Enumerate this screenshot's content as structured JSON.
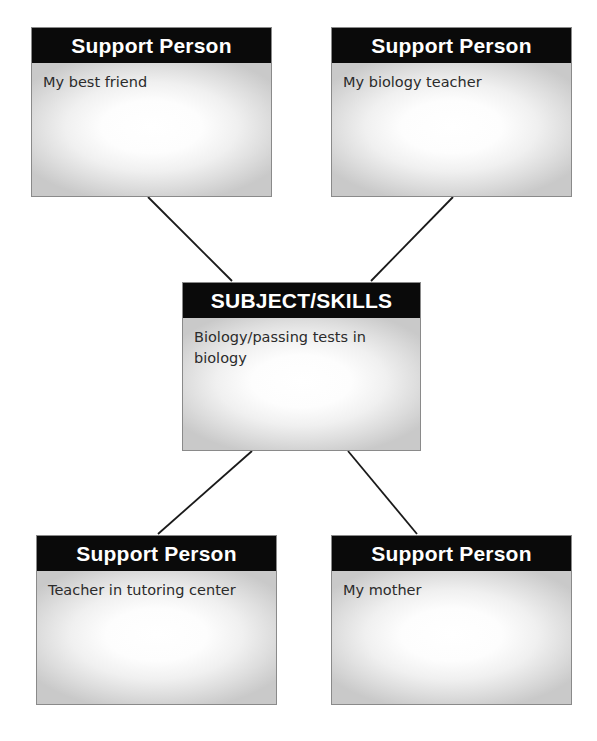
{
  "diagram": {
    "type": "support-network-map",
    "canvas": {
      "width": 597,
      "height": 741,
      "background": "#ffffff"
    },
    "style": {
      "header_background": "#0a0a0a",
      "header_text_color": "#ffffff",
      "body_gradient_center": "#ffffff",
      "body_gradient_edge": "#c9c9c9",
      "body_text_color": "#2b2b2b",
      "border_color": "#8a8a8a",
      "connector_color": "#1a1a1a"
    },
    "nodes": [
      {
        "id": "top-left",
        "role": "support-person",
        "header": "Support Person",
        "body": "My best friend"
      },
      {
        "id": "top-right",
        "role": "support-person",
        "header": "Support Person",
        "body": "My biology teacher"
      },
      {
        "id": "center",
        "role": "subject-skills",
        "header": "SUBJECT/SKILLS",
        "body": "Biology/passing tests in biology"
      },
      {
        "id": "bottom-left",
        "role": "support-person",
        "header": "Support Person",
        "body": "Teacher in tutoring center"
      },
      {
        "id": "bottom-right",
        "role": "support-person",
        "header": "Support Person",
        "body": "My mother"
      }
    ],
    "connectors": [
      {
        "id": "center-to-top-left",
        "from": "center",
        "to": "top-left",
        "x1": 232,
        "y1": 281,
        "x2": 148,
        "y2": 197
      },
      {
        "id": "center-to-top-right",
        "from": "center",
        "to": "top-right",
        "x1": 371,
        "y1": 281,
        "x2": 453,
        "y2": 197
      },
      {
        "id": "center-to-bottom-left",
        "from": "center",
        "to": "bottom-left",
        "x1": 252,
        "y1": 451,
        "x2": 158,
        "y2": 534
      },
      {
        "id": "center-to-bottom-right",
        "from": "center",
        "to": "bottom-right",
        "x1": 348,
        "y1": 451,
        "x2": 417,
        "y2": 534
      }
    ]
  }
}
